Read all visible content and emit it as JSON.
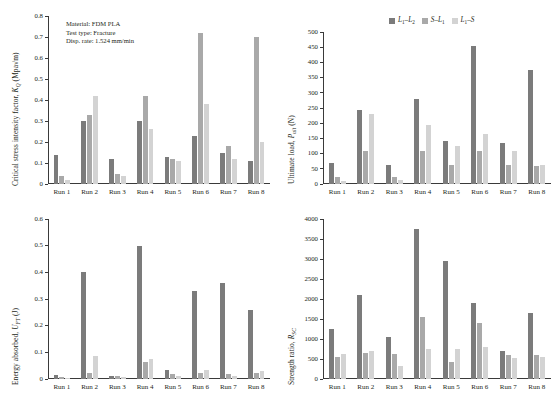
{
  "colors": {
    "series1": "#7b7b7b",
    "series2": "#a9a9a9",
    "series3": "#d3d3d3",
    "axis": "#3a3a3a"
  },
  "legend": {
    "items": [
      {
        "name": "L1-L2",
        "label_main": "L",
        "label_sub1": "1",
        "label_mid": "–L",
        "label_sub2": "2",
        "color": "#7b7b7b"
      },
      {
        "name": "S-L1",
        "label_main": "S",
        "label_sub1": "",
        "label_mid": "–L",
        "label_sub2": "1",
        "color": "#a9a9a9"
      },
      {
        "name": "L1-S",
        "label_main": "L",
        "label_sub1": "1",
        "label_mid": "–S",
        "label_sub2": "",
        "color": "#d3d3d3"
      }
    ]
  },
  "annotation": {
    "line1": "Material: FDM PLA",
    "line2": "Test type: Fracture",
    "line3": "Disp. rate: 1.524 mm/min"
  },
  "categories": [
    "Run 1",
    "Run 2",
    "Run 3",
    "Run 4",
    "Run 5",
    "Run 6",
    "Run 7",
    "Run 8"
  ],
  "chart_data": [
    {
      "id": "panel-a",
      "type": "bar",
      "title": "",
      "ylabel_parts": {
        "pre": "Critical stress intensity factor, ",
        "sym": "K",
        "sub": "Q",
        "post": " (Mpa√m)"
      },
      "xlabel": "",
      "categories": [
        "Run 1",
        "Run 2",
        "Run 3",
        "Run 4",
        "Run 5",
        "Run 6",
        "Run 7",
        "Run 8"
      ],
      "ylim": [
        0,
        0.8
      ],
      "yticks": [
        0,
        0.1,
        0.2,
        0.3,
        0.4,
        0.5,
        0.6,
        0.7,
        0.8
      ],
      "ytick_labels": [
        "0",
        "0.1",
        "0.2",
        "0.3",
        "0.4",
        "0.5",
        "0.6",
        "0.7",
        "0.8"
      ],
      "grid": false,
      "series": [
        {
          "name": "L1-L2",
          "color": "#7b7b7b",
          "values": [
            0.14,
            0.3,
            0.12,
            0.3,
            0.13,
            0.23,
            0.15,
            0.11
          ]
        },
        {
          "name": "S-L1",
          "color": "#a9a9a9",
          "values": [
            0.04,
            0.33,
            0.05,
            0.42,
            0.12,
            0.72,
            0.18,
            0.7
          ]
        },
        {
          "name": "L1-S",
          "color": "#d3d3d3",
          "values": [
            0.02,
            0.42,
            0.04,
            0.26,
            0.11,
            0.38,
            0.12,
            0.2
          ]
        }
      ]
    },
    {
      "id": "panel-b",
      "type": "bar",
      "title": "",
      "ylabel_parts": {
        "pre": "Ultimate load, ",
        "sym": "P",
        "sub": "ult",
        "post": " (N)"
      },
      "xlabel": "",
      "categories": [
        "Run 1",
        "Run 2",
        "Run 3",
        "Run 4",
        "Run 5",
        "Run 6",
        "Run 7",
        "Run 8"
      ],
      "ylim": [
        0,
        500
      ],
      "yticks": [
        0,
        50,
        100,
        150,
        200,
        250,
        300,
        350,
        400,
        450,
        500
      ],
      "ytick_labels": [
        "0",
        "50",
        "100",
        "150",
        "200",
        "250",
        "300",
        "350",
        "400",
        "450",
        "500"
      ],
      "grid": false,
      "series": [
        {
          "name": "L1-L2",
          "color": "#7b7b7b",
          "values": [
            70,
            245,
            62,
            278,
            140,
            455,
            135,
            375
          ]
        },
        {
          "name": "S-L1",
          "color": "#a9a9a9",
          "values": [
            22,
            110,
            22,
            110,
            62,
            110,
            62,
            60
          ]
        },
        {
          "name": "L1-S",
          "color": "#d3d3d3",
          "values": [
            10,
            230,
            12,
            195,
            125,
            165,
            110,
            62
          ]
        }
      ]
    },
    {
      "id": "panel-c",
      "type": "bar",
      "title": "",
      "ylabel_parts": {
        "pre": "Energy absorbed, ",
        "sym": "U",
        "sub": "FT",
        "post": " (J)"
      },
      "xlabel": "",
      "categories": [
        "Run 1",
        "Run 2",
        "Run 3",
        "Run 4",
        "Run 5",
        "Run 6",
        "Run 7",
        "Run 8"
      ],
      "ylim": [
        0,
        0.6
      ],
      "yticks": [
        0,
        0.1,
        0.2,
        0.3,
        0.4,
        0.5,
        0.6
      ],
      "ytick_labels": [
        "0",
        "0.1",
        "0.2",
        "0.3",
        "0.4",
        "0.5",
        "0.6"
      ],
      "grid": false,
      "series": [
        {
          "name": "L1-L2",
          "color": "#7b7b7b",
          "values": [
            0.015,
            0.4,
            0.012,
            0.5,
            0.033,
            0.33,
            0.36,
            0.26
          ]
        },
        {
          "name": "S-L1",
          "color": "#a9a9a9",
          "values": [
            0.008,
            0.022,
            0.01,
            0.065,
            0.02,
            0.022,
            0.02,
            0.022
          ]
        },
        {
          "name": "L1-S",
          "color": "#d3d3d3",
          "values": [
            0.005,
            0.085,
            0.006,
            0.075,
            0.012,
            0.035,
            0.012,
            0.03
          ]
        }
      ]
    },
    {
      "id": "panel-d",
      "type": "bar",
      "title": "",
      "ylabel_parts": {
        "pre": "Strength ratio, ",
        "sym": "R",
        "sub": "SC",
        "post": ""
      },
      "xlabel": "",
      "categories": [
        "Run 1",
        "Run 2",
        "Run 3",
        "Run 4",
        "Run 5",
        "Run 6",
        "Run 7",
        "Run 8"
      ],
      "ylim": [
        0,
        4000
      ],
      "yticks": [
        0,
        500,
        1000,
        1500,
        2000,
        2500,
        3000,
        3500,
        4000
      ],
      "ytick_labels": [
        "0",
        "500",
        "1000",
        "1500",
        "2000",
        "2500",
        "3000",
        "3500",
        "4000"
      ],
      "grid": false,
      "series": [
        {
          "name": "L1-L2",
          "color": "#7b7b7b",
          "values": [
            1250,
            2100,
            1050,
            3750,
            2950,
            1900,
            700,
            1650
          ]
        },
        {
          "name": "S-L1",
          "color": "#a9a9a9",
          "values": [
            560,
            640,
            620,
            1550,
            420,
            1400,
            600,
            600
          ]
        },
        {
          "name": "L1-S",
          "color": "#d3d3d3",
          "values": [
            620,
            700,
            330,
            760,
            760,
            800,
            520,
            560
          ]
        }
      ]
    }
  ]
}
